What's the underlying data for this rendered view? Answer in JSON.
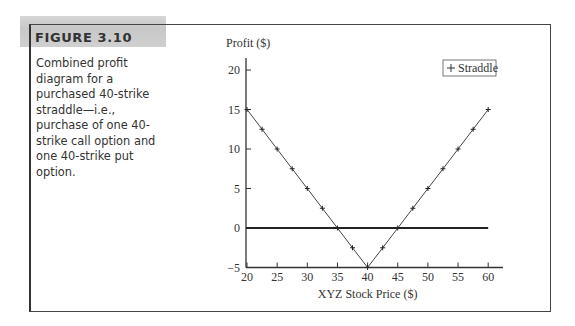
{
  "figure": {
    "label": "FIGURE 3.10",
    "caption": "Combined profit diagram for a purchased 40-strike straddle—i.e., purchase of one 40-strike call option and one 40-strike put option."
  },
  "chart_data": {
    "type": "line",
    "title": "",
    "xlabel": "XYZ Stock Price ($)",
    "ylabel": "Profit ($)",
    "xlim": [
      20,
      60
    ],
    "ylim": [
      -5,
      20
    ],
    "xticks": [
      20,
      25,
      30,
      35,
      40,
      45,
      50,
      55,
      60
    ],
    "yticks": [
      -5,
      0,
      5,
      10,
      15,
      20
    ],
    "grid": false,
    "legend_position": "top-right",
    "series": [
      {
        "name": "Straddle",
        "marker": "+",
        "x": [
          20,
          22.5,
          25,
          27.5,
          30,
          32.5,
          35,
          37.5,
          40,
          42.5,
          45,
          47.5,
          50,
          52.5,
          55,
          57.5,
          60
        ],
        "values": [
          15,
          12.5,
          10,
          7.5,
          5,
          2.5,
          0,
          -2.5,
          -5,
          -2.5,
          0,
          2.5,
          5,
          7.5,
          10,
          12.5,
          15
        ]
      }
    ],
    "reference_lines": [
      {
        "type": "horizontal",
        "y": 0,
        "x_range": [
          20,
          60
        ]
      }
    ]
  }
}
